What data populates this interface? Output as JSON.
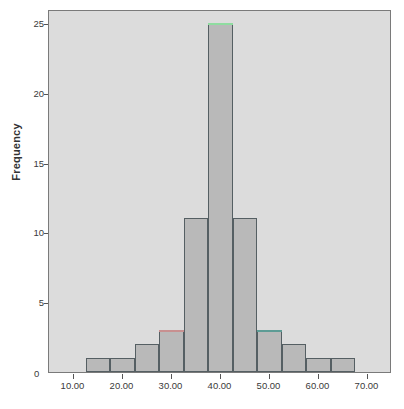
{
  "chart_data": {
    "type": "bar",
    "title": "",
    "subtitle": "",
    "xlabel": "",
    "ylabel": "Frequency",
    "grid": false,
    "legend_position": "none",
    "xlim": [
      5,
      75
    ],
    "ylim": [
      0,
      26
    ],
    "bin_width": 5,
    "x_ticks": [
      10,
      20,
      30,
      40,
      50,
      60,
      70
    ],
    "x_tick_labels": [
      "10.00",
      "20.00",
      "30.00",
      "40.00",
      "50.00",
      "60.00",
      "70.00"
    ],
    "y_ticks": [
      0,
      5,
      10,
      15,
      20,
      25
    ],
    "y_tick_labels": [
      "0",
      "5",
      "10",
      "15",
      "20",
      "25"
    ],
    "categories": [
      "12.5-17.5",
      "17.5-22.5",
      "22.5-27.5",
      "27.5-32.5",
      "32.5-37.5",
      "37.5-42.5",
      "42.5-47.5",
      "47.5-52.5",
      "52.5-57.5",
      "57.5-62.5",
      "62.5-67.5"
    ],
    "bin_starts": [
      12.5,
      17.5,
      22.5,
      27.5,
      32.5,
      37.5,
      42.5,
      47.5,
      52.5,
      57.5,
      62.5
    ],
    "values": [
      1,
      1,
      2,
      3,
      11,
      25,
      11,
      3,
      2,
      1,
      1
    ],
    "bar_top_colors": [
      "",
      "",
      "",
      "#c89090",
      "",
      "#8fdca0",
      "",
      "#5d9c95",
      "",
      "",
      ""
    ],
    "colors": {
      "bar_fill": "#b9b9b9",
      "bar_outline": "#555f63",
      "plot_background": "#dcdcdc",
      "frame": "#7a7a7a",
      "axis_text": "#3a3a3a",
      "page_background": "#ffffff"
    }
  }
}
